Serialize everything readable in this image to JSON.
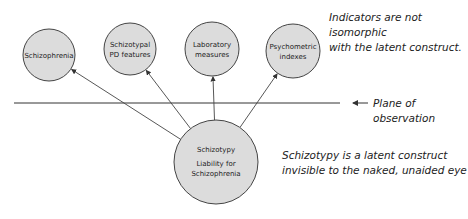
{
  "diagram": {
    "indicators": [
      {
        "label_lines": [
          "Schizophrenia"
        ],
        "cx": 49,
        "cy": 55,
        "r": 26
      },
      {
        "label_lines": [
          "Schizotypal",
          "PD features"
        ],
        "cx": 130,
        "cy": 49,
        "r": 26
      },
      {
        "label_lines": [
          "Laboratory",
          "measures"
        ],
        "cx": 212,
        "cy": 49,
        "r": 27
      },
      {
        "label_lines": [
          "Psychometric",
          "indexes"
        ],
        "cx": 293,
        "cy": 51,
        "r": 27
      }
    ],
    "latent": {
      "title": "Schizotypy",
      "subtitle_lines": [
        "Liability for",
        "Schizophrenia"
      ],
      "cx": 216,
      "cy": 162,
      "r": 42
    },
    "plane_label": "Plane of observation",
    "note_top": [
      "Indicators are not isomorphic",
      "with the latent construct."
    ],
    "note_bottom": [
      "Schizotypy is a latent construct",
      "invisible to the naked, unaided eye"
    ],
    "colors": {
      "circle_fill": "#dcdcdc",
      "stroke": "#444444"
    }
  }
}
